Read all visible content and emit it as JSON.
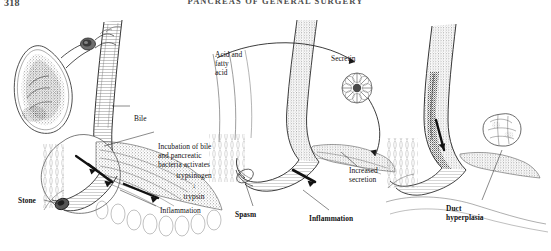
{
  "page": {
    "folio": "318",
    "running_head": "PANCREAS OF GENERAL SURGERY"
  },
  "figure": {
    "type": "medical-illustration",
    "medium": "pen-and-ink stipple drawing",
    "panels": [
      {
        "id": "left",
        "name": "biliary-obstruction-panel",
        "structures": [
          "gallbladder",
          "cystic duct",
          "common bile duct",
          "ampulla of Vater",
          "pancreatic duct",
          "duodenal wall",
          "pancreatic parenchyma"
        ],
        "labels": [
          {
            "id": "bile",
            "text": "Bile"
          },
          {
            "id": "incubation",
            "text": "Incubation of bile\nand pancreatic\nbacteria activates"
          },
          {
            "id": "trypsinogen",
            "text": "trypsinogen"
          },
          {
            "id": "arrow_down",
            "text": "↓"
          },
          {
            "id": "trypsin",
            "text": "trypsin"
          },
          {
            "id": "inflammation",
            "text": "Inflammation"
          },
          {
            "id": "stone",
            "text": "Stone"
          }
        ]
      },
      {
        "id": "middle",
        "name": "secretin-stimulation-panel",
        "structures": [
          "duodenal mucosa",
          "common channel",
          "pancreatic acinus",
          "sphincter of Oddi",
          "pancreatic duct"
        ],
        "labels": [
          {
            "id": "acid",
            "text": "Acid and\nfatty\nacid"
          },
          {
            "id": "secretin",
            "text": "Secretin"
          },
          {
            "id": "increased",
            "text": "Increased\nsecretion"
          },
          {
            "id": "spasm",
            "text": "Spasm"
          },
          {
            "id": "inflammation",
            "text": "Inflammation"
          }
        ]
      },
      {
        "id": "right",
        "name": "duct-hyperplasia-panel",
        "structures": [
          "pancreatic duct",
          "duodenal wall",
          "hyperplastic duct epithelium",
          "nodular mass"
        ],
        "labels": [
          {
            "id": "duct_hyperplasia",
            "text": "Duct\nhyperplasia"
          }
        ]
      }
    ]
  }
}
